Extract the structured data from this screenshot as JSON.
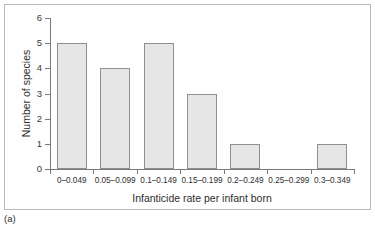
{
  "figure": {
    "caption": "(a)"
  },
  "chart_data": {
    "type": "bar",
    "title": "",
    "subtitle": "",
    "xlabel": "Infanticide rate per infant born",
    "ylabel": "Number of species",
    "categories": [
      "0–0.049",
      "0.05–0.099",
      "0.1–0.149",
      "0.15–0.199",
      "0.2–0.249",
      "0.25–0.299",
      "0.3–0.349"
    ],
    "values": [
      5,
      4,
      5,
      3,
      1,
      0,
      1
    ],
    "ylim": [
      0,
      6
    ],
    "yticks": [
      0,
      1,
      2,
      3,
      4,
      5,
      6
    ],
    "ytick_labels": [
      "0",
      "1",
      "2",
      "3",
      "4",
      "5",
      "6"
    ],
    "grid": false,
    "legend": null,
    "bar_fill": "#e6e6e6",
    "bar_edge": "#8f8f8f",
    "axis_color": "#7a7a7a",
    "frame_color": "#b9b9b9"
  }
}
